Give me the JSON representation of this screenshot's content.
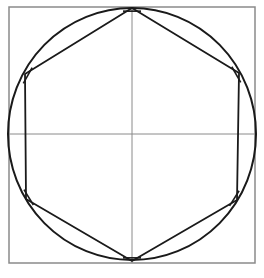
{
  "diagram": {
    "title": "Hexagon inscribed in a circle inside a square",
    "colors": {
      "background": "#ffffff",
      "square": "#8a8a8a",
      "axes": "#8a8a8a",
      "circle": "#1a1a1a",
      "hexagon": "#1a1a1a",
      "tick_marks": "#1a1a1a"
    },
    "square": {
      "x": 9,
      "y": 7,
      "width": 246,
      "height": 256
    },
    "axes": {
      "horizontal": {
        "x1": 9,
        "y1": 134,
        "x2": 255,
        "y2": 134
      },
      "vertical": {
        "x1": 132,
        "y1": 7,
        "x2": 132,
        "y2": 263
      }
    },
    "circle": {
      "cx": 132,
      "cy": 134,
      "rx": 124,
      "ry": 126
    },
    "hexagon_vertices": [
      {
        "name": "top",
        "x": 132,
        "y": 8
      },
      {
        "name": "upper-right",
        "x": 239,
        "y": 73
      },
      {
        "name": "lower-right",
        "x": 237,
        "y": 200
      },
      {
        "name": "bottom",
        "x": 132,
        "y": 261
      },
      {
        "name": "lower-left",
        "x": 26,
        "y": 199
      },
      {
        "name": "upper-left",
        "x": 25,
        "y": 74
      }
    ]
  }
}
